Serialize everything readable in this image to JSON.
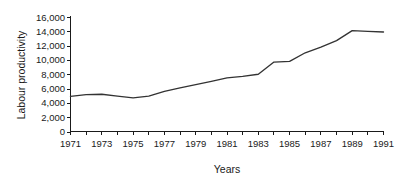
{
  "chart_data": {
    "type": "line",
    "title": "",
    "xlabel": "Years",
    "ylabel": "Labour productivity",
    "x": [
      1971,
      1972,
      1973,
      1974,
      1975,
      1976,
      1977,
      1978,
      1979,
      1980,
      1981,
      1982,
      1983,
      1984,
      1985,
      1986,
      1987,
      1988,
      1989,
      1990,
      1991
    ],
    "values": [
      4900,
      5150,
      5200,
      4950,
      4700,
      4950,
      5600,
      6100,
      6550,
      7000,
      7500,
      7700,
      8000,
      9700,
      9800,
      11000,
      11800,
      12700,
      14100,
      14000,
      13900
    ],
    "series": [
      {
        "name": "Labour productivity",
        "values": [
          4900,
          5150,
          5200,
          4950,
          4700,
          4950,
          5600,
          6100,
          6550,
          7000,
          7500,
          7700,
          8000,
          9700,
          9800,
          11000,
          11800,
          12700,
          14100,
          14000,
          13900
        ]
      }
    ],
    "xlim": [
      1971,
      1991
    ],
    "ylim": [
      0,
      16000
    ],
    "y_ticks": [
      0,
      2000,
      4000,
      6000,
      8000,
      10000,
      12000,
      14000,
      16000
    ],
    "y_tick_labels": [
      "0",
      "2,000",
      "4,000",
      "6,000",
      "8,000",
      "10,000",
      "12,000",
      "14,000",
      "16,000"
    ],
    "x_ticks": [
      1971,
      1972,
      1973,
      1974,
      1975,
      1976,
      1977,
      1978,
      1979,
      1980,
      1981,
      1982,
      1983,
      1984,
      1985,
      1986,
      1987,
      1988,
      1989,
      1990,
      1991
    ],
    "x_tick_labels": [
      "1971",
      "",
      "1973",
      "",
      "1975",
      "",
      "1977",
      "",
      "1979",
      "",
      "1981",
      "",
      "1983",
      "",
      "1985",
      "",
      "1987",
      "",
      "1989",
      "",
      "1991"
    ],
    "grid": false,
    "legend": false,
    "legend_position": "none",
    "line_color": "#333333"
  }
}
